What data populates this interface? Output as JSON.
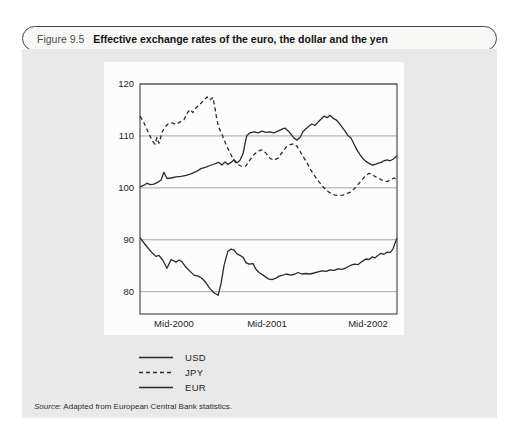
{
  "figure": {
    "label": "Figure 9.5",
    "title": "Effective exchange rates of the euro, the dollar and the yen"
  },
  "source": {
    "prefix": "Source:",
    "text": " Adapted from European Central Bank statistics."
  },
  "legend": {
    "items": [
      {
        "name": "USD",
        "style": "solid"
      },
      {
        "name": "JPY",
        "style": "dashed"
      },
      {
        "name": "EUR",
        "style": "solid"
      }
    ]
  },
  "colors": {
    "panel_bg": "#e9e9e9",
    "pill_bg": "#f7f7f6",
    "pill_border": "#4a4a4a",
    "line": "#2b2b2b",
    "grid": "#8f8f8f",
    "frame": "#3f3f3f",
    "chart_bg": "#fcfcfc",
    "text": "#1e1e1e"
  },
  "chart_data": {
    "type": "line",
    "title": "Effective exchange rates of the euro, the dollar and the yen",
    "xlabel": "",
    "ylabel": "",
    "grid": "horizontal",
    "legend_position": "below-left",
    "y_gridlines": [
      120,
      110,
      100,
      90,
      80
    ],
    "ylim_top": 120,
    "ylim_bottom": 75.7,
    "x_unit": "percent-of-axis (approx. Jan 2000 to Dec 2002)",
    "x_ticks": [
      {
        "label": "Mid-2000",
        "pos": 13.2
      },
      {
        "label": "Mid-2001",
        "pos": 49.4
      },
      {
        "label": "Mid-2002",
        "pos": 88.7
      }
    ],
    "series": [
      {
        "name": "USD",
        "style": "solid",
        "points": [
          [
            0,
            100.2
          ],
          [
            1.6,
            100.5
          ],
          [
            2.7,
            100.9
          ],
          [
            3.9,
            100.6
          ],
          [
            5.4,
            100.7
          ],
          [
            7.0,
            101.1
          ],
          [
            8.2,
            101.5
          ],
          [
            9.3,
            103.0
          ],
          [
            10.5,
            101.8
          ],
          [
            12.1,
            101.9
          ],
          [
            14.0,
            102.1
          ],
          [
            16.0,
            102.2
          ],
          [
            17.9,
            102.4
          ],
          [
            19.8,
            102.7
          ],
          [
            21.8,
            103.1
          ],
          [
            23.7,
            103.7
          ],
          [
            25.7,
            104.0
          ],
          [
            27.2,
            104.3
          ],
          [
            28.4,
            104.5
          ],
          [
            29.6,
            104.7
          ],
          [
            30.7,
            104.9
          ],
          [
            31.9,
            104.4
          ],
          [
            33.1,
            105.0
          ],
          [
            34.2,
            104.5
          ],
          [
            35.4,
            104.9
          ],
          [
            36.6,
            105.4
          ],
          [
            37.7,
            104.8
          ],
          [
            38.9,
            105.3
          ],
          [
            40.1,
            106.6
          ],
          [
            40.9,
            108.6
          ],
          [
            41.6,
            110.1
          ],
          [
            42.8,
            110.6
          ],
          [
            44.4,
            110.8
          ],
          [
            45.9,
            110.6
          ],
          [
            47.5,
            110.9
          ],
          [
            49.0,
            110.7
          ],
          [
            50.6,
            110.8
          ],
          [
            52.1,
            110.6
          ],
          [
            53.7,
            110.9
          ],
          [
            55.3,
            111.3
          ],
          [
            56.4,
            111.5
          ],
          [
            57.6,
            111.0
          ],
          [
            58.8,
            110.3
          ],
          [
            59.9,
            109.6
          ],
          [
            61.1,
            109.2
          ],
          [
            62.3,
            109.7
          ],
          [
            63.4,
            110.8
          ],
          [
            64.6,
            111.4
          ],
          [
            65.8,
            111.9
          ],
          [
            66.9,
            112.3
          ],
          [
            68.1,
            112.0
          ],
          [
            69.3,
            112.7
          ],
          [
            70.4,
            113.2
          ],
          [
            71.6,
            113.8
          ],
          [
            72.8,
            113.5
          ],
          [
            73.9,
            114.0
          ],
          [
            75.1,
            113.4
          ],
          [
            76.3,
            113.1
          ],
          [
            77.4,
            112.5
          ],
          [
            78.6,
            111.7
          ],
          [
            79.8,
            110.9
          ],
          [
            80.9,
            110.1
          ],
          [
            82.1,
            109.6
          ],
          [
            83.3,
            108.4
          ],
          [
            84.4,
            107.3
          ],
          [
            85.6,
            106.4
          ],
          [
            86.8,
            105.6
          ],
          [
            87.9,
            105.1
          ],
          [
            89.1,
            104.7
          ],
          [
            90.3,
            104.4
          ],
          [
            91.4,
            104.5
          ],
          [
            92.6,
            104.7
          ],
          [
            93.8,
            104.9
          ],
          [
            94.9,
            105.2
          ],
          [
            96.1,
            105.4
          ],
          [
            97.3,
            105.2
          ],
          [
            98.4,
            105.5
          ],
          [
            99.2,
            105.8
          ],
          [
            100,
            106.2
          ]
        ]
      },
      {
        "name": "JPY",
        "style": "dashed",
        "points": [
          [
            0,
            113.8
          ],
          [
            1.2,
            112.9
          ],
          [
            2.3,
            111.7
          ],
          [
            3.5,
            110.4
          ],
          [
            4.7,
            109.1
          ],
          [
            5.8,
            108.4
          ],
          [
            6.6,
            109.7
          ],
          [
            7.4,
            108.6
          ],
          [
            8.6,
            110.7
          ],
          [
            9.7,
            111.7
          ],
          [
            10.9,
            112.3
          ],
          [
            12.5,
            112.5
          ],
          [
            14.0,
            112.2
          ],
          [
            15.6,
            112.7
          ],
          [
            17.1,
            113.1
          ],
          [
            18.3,
            114.3
          ],
          [
            19.5,
            115.1
          ],
          [
            20.6,
            114.5
          ],
          [
            21.8,
            115.4
          ],
          [
            23.3,
            116.1
          ],
          [
            24.9,
            116.9
          ],
          [
            26.1,
            117.5
          ],
          [
            27.2,
            116.9
          ],
          [
            28.4,
            117.4
          ],
          [
            29.2,
            115.3
          ],
          [
            30.0,
            112.9
          ],
          [
            30.7,
            111.6
          ],
          [
            31.9,
            110.3
          ],
          [
            33.5,
            108.3
          ],
          [
            35.0,
            106.8
          ],
          [
            36.6,
            105.2
          ],
          [
            38.1,
            104.5
          ],
          [
            39.7,
            104.1
          ],
          [
            41.2,
            104.2
          ],
          [
            42.8,
            105.4
          ],
          [
            44.4,
            106.4
          ],
          [
            45.9,
            107.1
          ],
          [
            47.5,
            107.3
          ],
          [
            49.0,
            106.7
          ],
          [
            50.6,
            105.7
          ],
          [
            52.1,
            105.3
          ],
          [
            53.7,
            105.7
          ],
          [
            55.3,
            106.8
          ],
          [
            56.8,
            107.8
          ],
          [
            58.4,
            108.3
          ],
          [
            59.9,
            108.5
          ],
          [
            61.1,
            108.0
          ],
          [
            62.3,
            107.0
          ],
          [
            63.4,
            106.1
          ],
          [
            65.0,
            104.8
          ],
          [
            66.5,
            103.4
          ],
          [
            68.1,
            102.2
          ],
          [
            69.6,
            101.2
          ],
          [
            71.2,
            100.2
          ],
          [
            72.8,
            99.4
          ],
          [
            74.3,
            98.9
          ],
          [
            75.9,
            98.6
          ],
          [
            77.4,
            98.5
          ],
          [
            79.0,
            98.6
          ],
          [
            80.5,
            98.9
          ],
          [
            82.1,
            99.2
          ],
          [
            83.3,
            99.8
          ],
          [
            84.4,
            100.4
          ],
          [
            86.0,
            101.3
          ],
          [
            87.5,
            102.2
          ],
          [
            89.1,
            102.8
          ],
          [
            90.3,
            102.6
          ],
          [
            91.4,
            102.2
          ],
          [
            93.0,
            101.8
          ],
          [
            94.6,
            101.4
          ],
          [
            96.1,
            101.2
          ],
          [
            97.7,
            101.6
          ],
          [
            98.8,
            101.9
          ],
          [
            100,
            101.7
          ]
        ]
      },
      {
        "name": "EUR",
        "style": "solid",
        "points": [
          [
            0,
            90.4
          ],
          [
            2.3,
            88.9
          ],
          [
            4.3,
            87.7
          ],
          [
            6.2,
            86.8
          ],
          [
            7.4,
            87.0
          ],
          [
            8.9,
            86.0
          ],
          [
            10.5,
            84.5
          ],
          [
            12.1,
            86.2
          ],
          [
            14.0,
            85.7
          ],
          [
            15.2,
            86.1
          ],
          [
            16.3,
            85.8
          ],
          [
            17.9,
            84.7
          ],
          [
            19.5,
            83.9
          ],
          [
            21.0,
            83.2
          ],
          [
            22.6,
            83.0
          ],
          [
            24.1,
            82.6
          ],
          [
            25.7,
            81.7
          ],
          [
            27.2,
            80.6
          ],
          [
            28.8,
            79.8
          ],
          [
            30.4,
            79.3
          ],
          [
            31.5,
            81.5
          ],
          [
            32.7,
            85.0
          ],
          [
            34.2,
            87.8
          ],
          [
            35.4,
            88.2
          ],
          [
            36.6,
            88.0
          ],
          [
            37.7,
            87.3
          ],
          [
            38.9,
            87.0
          ],
          [
            40.1,
            86.6
          ],
          [
            41.2,
            85.6
          ],
          [
            42.4,
            85.3
          ],
          [
            44.0,
            85.4
          ],
          [
            45.1,
            84.3
          ],
          [
            46.3,
            83.7
          ],
          [
            47.9,
            83.2
          ],
          [
            49.0,
            82.8
          ],
          [
            50.2,
            82.4
          ],
          [
            51.4,
            82.3
          ],
          [
            52.9,
            82.6
          ],
          [
            54.1,
            83.0
          ],
          [
            55.6,
            83.2
          ],
          [
            56.8,
            83.4
          ],
          [
            58.8,
            83.2
          ],
          [
            60.3,
            83.4
          ],
          [
            61.5,
            83.7
          ],
          [
            63.0,
            83.4
          ],
          [
            64.6,
            83.5
          ],
          [
            66.1,
            83.4
          ],
          [
            67.7,
            83.6
          ],
          [
            69.3,
            83.8
          ],
          [
            70.8,
            84.0
          ],
          [
            72.4,
            83.9
          ],
          [
            73.9,
            84.2
          ],
          [
            75.5,
            84.1
          ],
          [
            77.0,
            84.4
          ],
          [
            78.6,
            84.3
          ],
          [
            80.2,
            84.6
          ],
          [
            81.7,
            85.0
          ],
          [
            83.3,
            85.3
          ],
          [
            84.8,
            85.2
          ],
          [
            86.4,
            85.8
          ],
          [
            87.9,
            86.3
          ],
          [
            89.1,
            86.2
          ],
          [
            90.3,
            86.7
          ],
          [
            91.4,
            86.5
          ],
          [
            92.6,
            87.0
          ],
          [
            93.8,
            87.4
          ],
          [
            94.9,
            87.2
          ],
          [
            96.1,
            87.6
          ],
          [
            97.3,
            87.5
          ],
          [
            98.4,
            88.2
          ],
          [
            99.2,
            89.3
          ],
          [
            100,
            90.3
          ]
        ]
      }
    ]
  }
}
